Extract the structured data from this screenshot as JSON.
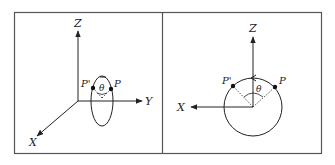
{
  "figure": {
    "panels": [
      {
        "id": "left",
        "description": "3D perspective view: elliptical orbit in a vertical plane parallel to XZ, points P and P' on it with angle theta",
        "axes": {
          "z_label": "Z",
          "y_label": "Y",
          "x_label": "X"
        },
        "points": {
          "p_label": "P",
          "p_prime_label": "P'"
        },
        "angle_label": "θ"
      },
      {
        "id": "right",
        "description": "Front view (XZ plane): circle centered at origin, points P and P' on upper arc, angle theta between them, arrow on arc at top",
        "axes": {
          "z_label": "Z",
          "x_label": "X"
        },
        "points": {
          "p_label": "P",
          "p_prime_label": "P'"
        },
        "angle_label": "θ"
      }
    ],
    "colors": {
      "line": "#333333",
      "frame": "#555555",
      "background": "#ffffff"
    }
  }
}
